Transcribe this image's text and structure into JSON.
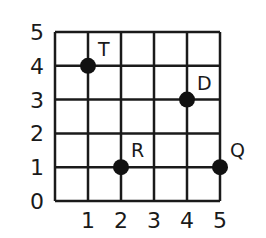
{
  "chart_data": {
    "type": "scatter",
    "title": "",
    "xlabel": "",
    "ylabel": "",
    "xlim": [
      0,
      5
    ],
    "ylim": [
      0,
      5
    ],
    "grid": true,
    "x_ticks": [
      "1",
      "2",
      "3",
      "4",
      "5"
    ],
    "y_ticks": [
      "0",
      "1",
      "2",
      "3",
      "4",
      "5"
    ],
    "points": [
      {
        "label": "T",
        "x": 1,
        "y": 4
      },
      {
        "label": "D",
        "x": 4,
        "y": 3
      },
      {
        "label": "R",
        "x": 2,
        "y": 1
      },
      {
        "label": "Q",
        "x": 5,
        "y": 1
      }
    ]
  },
  "colors": {
    "grid": "#1a1a1a",
    "point": "#111111",
    "background": "#ffffff"
  }
}
